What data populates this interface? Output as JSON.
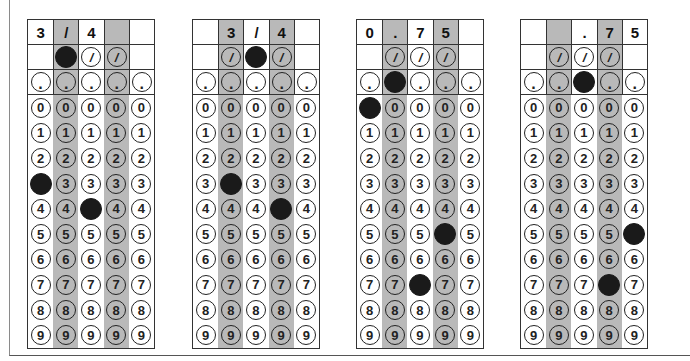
{
  "grids": [
    {
      "id": "grid-1",
      "left": 27,
      "entered": [
        "3",
        "/",
        "4",
        "",
        ""
      ],
      "shaded_columns": [
        1,
        3
      ],
      "slash_bubbles": [
        false,
        true,
        true,
        true,
        false
      ],
      "filled": {
        "slash": [
          1
        ],
        "dot": [],
        "digits": {
          "0": 3,
          "2": 4
        }
      }
    },
    {
      "id": "grid-2",
      "left": 192,
      "entered": [
        "",
        "3",
        "/",
        "4",
        ""
      ],
      "shaded_columns": [
        1,
        3
      ],
      "slash_bubbles": [
        false,
        true,
        true,
        true,
        false
      ],
      "filled": {
        "slash": [
          2
        ],
        "dot": [],
        "digits": {
          "1": 3,
          "3": 4
        }
      }
    },
    {
      "id": "grid-3",
      "left": 356,
      "entered": [
        "0",
        ".",
        "7",
        "5",
        ""
      ],
      "shaded_columns": [
        1,
        3
      ],
      "slash_bubbles": [
        false,
        true,
        true,
        true,
        false
      ],
      "filled": {
        "slash": [],
        "dot": [
          1
        ],
        "digits": {
          "0": 0,
          "2": 7,
          "3": 5
        }
      }
    },
    {
      "id": "grid-4",
      "left": 520,
      "entered": [
        "",
        "",
        ".",
        "7",
        "5"
      ],
      "shaded_columns": [
        1,
        3
      ],
      "slash_bubbles": [
        false,
        true,
        true,
        true,
        false
      ],
      "filled": {
        "slash": [],
        "dot": [
          2
        ],
        "digits": {
          "3": 7,
          "4": 5
        }
      }
    }
  ],
  "symbols": {
    "slash": "/",
    "dot": ".",
    "digits": [
      "0",
      "1",
      "2",
      "3",
      "4",
      "5",
      "6",
      "7",
      "8",
      "9"
    ]
  },
  "colors": {
    "shade": "#b9b9b9",
    "fill": "#1a1a1a",
    "border": "#333333"
  }
}
